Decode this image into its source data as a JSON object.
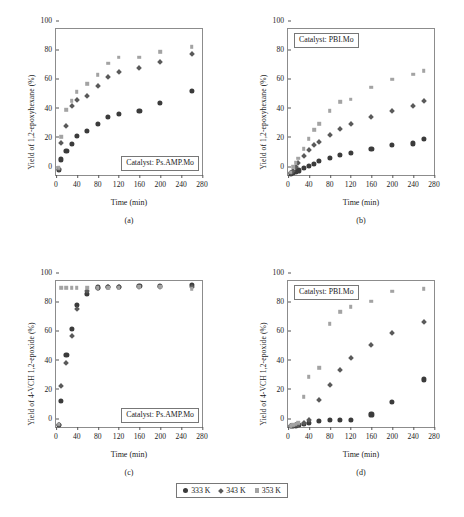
{
  "figure": {
    "legend": {
      "items": [
        {
          "label": "333 K",
          "marker": "circle-marker",
          "color": "#3b3b3b"
        },
        {
          "label": "343 K",
          "marker": "diamond-marker",
          "color": "#5a5a5a"
        },
        {
          "label": "353 K",
          "marker": "square-marker",
          "color": "#a3a3a3"
        }
      ]
    }
  },
  "chart_data": [
    {
      "id": "panel-a",
      "type": "scatter",
      "caption": "(a)",
      "title": "",
      "annotation": "Catalyst: Ps.AMP.Mo",
      "xlabel": "Time (min)",
      "ylabel": "Yield of 1,2-epoxyhexane (%)",
      "xlim": [
        0,
        280
      ],
      "ylim": [
        0,
        100
      ],
      "xticks": [
        0,
        40,
        80,
        120,
        160,
        200,
        240,
        280
      ],
      "yticks": [
        0,
        20,
        40,
        60,
        80,
        100
      ],
      "grid": false,
      "legend_position": "bottom-shared",
      "series": [
        {
          "name": "333 K",
          "marker": "circle-marker",
          "color": "#3b3b3b",
          "x": [
            5,
            10,
            20,
            30,
            40,
            60,
            80,
            100,
            120,
            160,
            200,
            260
          ],
          "y": [
            3.5,
            10.5,
            16.5,
            21.0,
            26.5,
            30.0,
            35.0,
            39.5,
            42.0,
            44.0,
            49.5,
            57.5
          ]
        },
        {
          "name": "343 K",
          "marker": "diamond-marker",
          "color": "#5a5a5a",
          "x": [
            5,
            10,
            20,
            30,
            40,
            60,
            80,
            100,
            120,
            160,
            200,
            260
          ],
          "y": [
            4.5,
            22.5,
            34.0,
            47.5,
            51.5,
            54.5,
            61.5,
            67.5,
            70.5,
            73.5,
            77.5,
            83.0
          ]
        },
        {
          "name": "353 K",
          "marker": "square-marker",
          "color": "#a3a3a3",
          "x": [
            5,
            10,
            20,
            30,
            40,
            60,
            80,
            100,
            120,
            160,
            200,
            260
          ],
          "y": [
            5.0,
            26.0,
            44.5,
            51.0,
            57.0,
            62.5,
            68.5,
            76.5,
            80.5,
            80.5,
            84.5,
            88.0
          ]
        }
      ]
    },
    {
      "id": "panel-b",
      "type": "scatter",
      "caption": "(b)",
      "title": "",
      "annotation": "Catalyst: PBI.Mo",
      "xlabel": "Time (min)",
      "ylabel": "Yield of 1,2-epoxyhexane (%)",
      "xlim": [
        0,
        280
      ],
      "ylim": [
        0,
        100
      ],
      "xticks": [
        0,
        40,
        80,
        120,
        160,
        200,
        240,
        280
      ],
      "yticks": [
        0,
        20,
        40,
        60,
        80,
        100
      ],
      "grid": false,
      "legend_position": "bottom-shared",
      "series": [
        {
          "name": "333 K",
          "marker": "circle-marker",
          "color": "#3b3b3b",
          "x": [
            5,
            10,
            15,
            20,
            30,
            40,
            50,
            60,
            80,
            100,
            120,
            160,
            200,
            240,
            260
          ],
          "y": [
            1.0,
            1.5,
            2.0,
            3.0,
            4.5,
            6.0,
            7.5,
            9.5,
            11.5,
            13.5,
            15.0,
            18.0,
            20.5,
            21.5,
            24.5
          ]
        },
        {
          "name": "343 K",
          "marker": "diamond-marker",
          "color": "#5a5a5a",
          "x": [
            5,
            10,
            15,
            20,
            30,
            40,
            50,
            60,
            80,
            100,
            120,
            160,
            200,
            240,
            260
          ],
          "y": [
            1.5,
            3.0,
            5.5,
            8.5,
            13.5,
            17.5,
            20.5,
            23.0,
            27.5,
            31.5,
            35.0,
            40.0,
            44.0,
            47.5,
            51.0
          ]
        },
        {
          "name": "353 K",
          "marker": "square-marker",
          "color": "#a3a3a3",
          "x": [
            5,
            10,
            15,
            20,
            30,
            40,
            50,
            60,
            80,
            100,
            120,
            160,
            200,
            240,
            260
          ],
          "y": [
            2.0,
            5.5,
            8.5,
            11.5,
            18.0,
            25.0,
            31.0,
            35.0,
            44.0,
            50.0,
            52.0,
            60.0,
            65.5,
            69.0,
            71.5
          ]
        }
      ]
    },
    {
      "id": "panel-c",
      "type": "scatter",
      "caption": "(c)",
      "title": "",
      "annotation": "Catalyst: Ps.AMP.Mo",
      "xlabel": "Time (min)",
      "ylabel": "Yield of 4-VCH 1,2-epoxide (%)",
      "xlim": [
        0,
        280
      ],
      "ylim": [
        0,
        100
      ],
      "xticks": [
        0,
        40,
        80,
        120,
        160,
        200,
        240,
        280
      ],
      "yticks": [
        0,
        20,
        40,
        60,
        80,
        100
      ],
      "grid": false,
      "legend_position": "bottom-shared",
      "series": [
        {
          "name": "333 K",
          "marker": "circle-marker",
          "color": "#3b3b3b",
          "x": [
            5,
            10,
            20,
            30,
            40,
            60,
            80,
            100,
            120,
            160,
            200,
            260
          ],
          "y": [
            1.5,
            18.0,
            49.5,
            67.0,
            83.5,
            91.0,
            95.5,
            96.0,
            96.0,
            96.5,
            96.5,
            97.0
          ]
        },
        {
          "name": "343 K",
          "marker": "diamond-marker",
          "color": "#5a5a5a",
          "x": [
            5,
            10,
            20,
            30,
            40,
            60,
            80,
            100,
            120,
            160,
            200,
            260
          ],
          "y": [
            1.5,
            28.5,
            44.0,
            62.5,
            81.0,
            93.5,
            95.5,
            96.0,
            96.0,
            96.5,
            96.5,
            96.5
          ]
        },
        {
          "name": "353 K",
          "marker": "square-marker",
          "color": "#a3a3a3",
          "x": [
            5,
            10,
            20,
            30,
            40,
            60,
            80,
            100,
            120,
            160,
            200,
            260
          ],
          "y": [
            2.0,
            95.5,
            95.5,
            95.5,
            95.5,
            95.5,
            95.5,
            95.5,
            95.5,
            96.0,
            96.0,
            94.5
          ]
        }
      ]
    },
    {
      "id": "panel-d",
      "type": "scatter",
      "caption": "(d)",
      "title": "",
      "annotation": "Catalyst: PBI.Mo",
      "xlabel": "Time (min)",
      "ylabel": "Yield of 4-VCH 1,2-epoxide (%)",
      "xlim": [
        0,
        280
      ],
      "ylim": [
        0,
        100
      ],
      "xticks": [
        0,
        40,
        80,
        120,
        160,
        200,
        240,
        280
      ],
      "yticks": [
        0,
        20,
        40,
        60,
        80,
        100
      ],
      "grid": false,
      "legend_position": "bottom-shared",
      "series": [
        {
          "name": "333 K",
          "marker": "circle-marker",
          "color": "#3b3b3b",
          "x": [
            5,
            10,
            15,
            20,
            30,
            40,
            60,
            80,
            100,
            120,
            160,
            200,
            260
          ],
          "y": [
            0.5,
            0.8,
            1.0,
            1.5,
            2.0,
            2.5,
            4.0,
            4.5,
            5.0,
            5.0,
            8.5,
            17.0,
            32.5
          ]
        },
        {
          "name": "343 K",
          "marker": "diamond-marker",
          "color": "#5a5a5a",
          "x": [
            5,
            10,
            15,
            20,
            30,
            40,
            60,
            80,
            100,
            120,
            160,
            200,
            260
          ],
          "y": [
            0.8,
            1.2,
            1.5,
            2.0,
            3.0,
            5.0,
            18.5,
            29.0,
            39.0,
            47.5,
            56.5,
            65.0,
            72.0
          ]
        },
        {
          "name": "353 K",
          "marker": "square-marker",
          "color": "#a3a3a3",
          "x": [
            5,
            10,
            15,
            20,
            30,
            40,
            60,
            80,
            100,
            120,
            160,
            200,
            260
          ],
          "y": [
            1.0,
            1.5,
            2.0,
            3.0,
            20.5,
            34.5,
            40.5,
            70.5,
            79.0,
            82.5,
            86.0,
            93.0,
            94.5
          ]
        }
      ]
    }
  ]
}
